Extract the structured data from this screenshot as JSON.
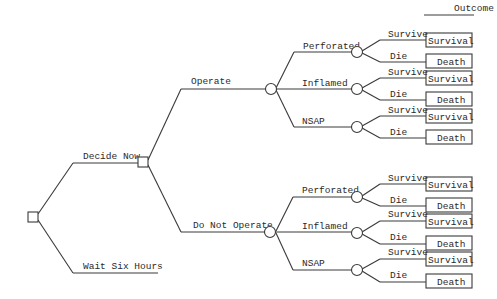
{
  "header": {
    "outcome_label": "Outcome"
  },
  "root": {
    "type": "decision",
    "branches": [
      {
        "label": "Decide Now"
      },
      {
        "label": "Wait Six Hours"
      }
    ]
  },
  "decide_now": {
    "type": "decision",
    "branches": [
      {
        "label": "Operate"
      },
      {
        "label": "Do Not Operate"
      }
    ]
  },
  "operate": {
    "type": "chance",
    "branches": [
      {
        "label": "Perforated",
        "outcomes": [
          {
            "edge": "Survive",
            "result": "Survival"
          },
          {
            "edge": "Die",
            "result": "Death"
          }
        ]
      },
      {
        "label": "Inflamed",
        "outcomes": [
          {
            "edge": "Survive",
            "result": "Survival"
          },
          {
            "edge": "Die",
            "result": "Death"
          }
        ]
      },
      {
        "label": "NSAP",
        "outcomes": [
          {
            "edge": "Survive",
            "result": "Survival"
          },
          {
            "edge": "Die",
            "result": "Death"
          }
        ]
      }
    ]
  },
  "do_not_operate": {
    "type": "chance",
    "branches": [
      {
        "label": "Perforated",
        "outcomes": [
          {
            "edge": "Survive",
            "result": "Survival"
          },
          {
            "edge": "Die",
            "result": "Death"
          }
        ]
      },
      {
        "label": "Inflamed",
        "outcomes": [
          {
            "edge": "Survive",
            "result": "Survival"
          },
          {
            "edge": "Die",
            "result": "Death"
          }
        ]
      },
      {
        "label": "NSAP",
        "outcomes": [
          {
            "edge": "Survive",
            "result": "Survival"
          },
          {
            "edge": "Die",
            "result": "Death"
          }
        ]
      }
    ]
  }
}
